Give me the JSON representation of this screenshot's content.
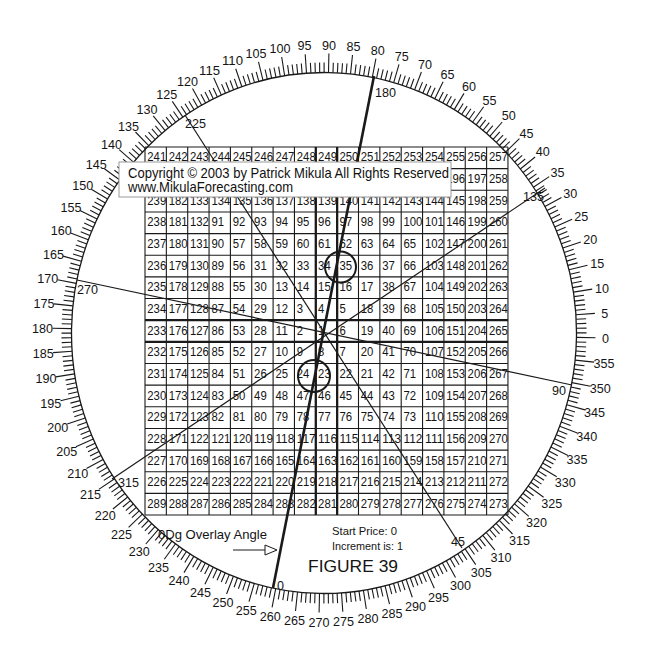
{
  "figure": {
    "caption": "FIGURE  39",
    "start_price": "Start Price: 0",
    "increment": "Increment is: 1",
    "overlay_angle_note": "0Dg Overlay Angle",
    "copyright_line1": "Copyright © 2003 by Patrick Mikula All Rights Reserved",
    "copyright_line2": "www.MikulaForecasting.com",
    "arrow_icon": "arrow-right-icon"
  },
  "degree_ring": {
    "tick_step_deg": 1,
    "label_step_deg": 5,
    "direction": "counterclockwise, 0 at right",
    "labels": [
      "0",
      "5",
      "10",
      "15",
      "20",
      "25",
      "30",
      "35",
      "40",
      "45",
      "50",
      "55",
      "60",
      "65",
      "70",
      "75",
      "80",
      "85",
      "90",
      "95",
      "100",
      "105",
      "110",
      "115",
      "120",
      "125",
      "130",
      "135",
      "140",
      "145",
      "150",
      "155",
      "160",
      "165",
      "170",
      "175",
      "180",
      "185",
      "190",
      "195",
      "200",
      "205",
      "210",
      "215",
      "220",
      "225",
      "230",
      "235",
      "240",
      "245",
      "250",
      "255",
      "260",
      "265",
      "270",
      "275",
      "280",
      "285",
      "290",
      "295",
      "300",
      "305",
      "310",
      "315",
      "320",
      "325",
      "330",
      "335",
      "340",
      "345",
      "350",
      "355"
    ]
  },
  "square_of_nine": {
    "start_price": 0,
    "increment": 1,
    "size": 17,
    "center_value": 1,
    "rows": [
      [
        241,
        242,
        243,
        244,
        245,
        246,
        247,
        248,
        249,
        250,
        251,
        252,
        253,
        254,
        255,
        256,
        257
      ],
      [
        240,
        183,
        184,
        185,
        186,
        187,
        188,
        189,
        190,
        191,
        192,
        193,
        194,
        195,
        196,
        197,
        258
      ],
      [
        239,
        182,
        133,
        134,
        135,
        136,
        137,
        138,
        139,
        140,
        141,
        142,
        143,
        144,
        145,
        198,
        259
      ],
      [
        238,
        181,
        132,
        91,
        92,
        93,
        94,
        95,
        96,
        97,
        98,
        99,
        100,
        101,
        146,
        199,
        260
      ],
      [
        237,
        180,
        131,
        90,
        57,
        58,
        59,
        60,
        61,
        62,
        63,
        64,
        65,
        102,
        147,
        200,
        261
      ],
      [
        236,
        179,
        130,
        89,
        56,
        31,
        32,
        33,
        34,
        35,
        36,
        37,
        66,
        103,
        148,
        201,
        262
      ],
      [
        235,
        178,
        129,
        88,
        55,
        30,
        13,
        14,
        15,
        16,
        17,
        38,
        67,
        104,
        149,
        202,
        263
      ],
      [
        234,
        177,
        128,
        87,
        54,
        29,
        12,
        3,
        4,
        5,
        18,
        39,
        68,
        105,
        150,
        203,
        264
      ],
      [
        233,
        176,
        127,
        86,
        53,
        28,
        11,
        2,
        1,
        6,
        19,
        40,
        69,
        106,
        151,
        204,
        265
      ],
      [
        232,
        175,
        126,
        85,
        52,
        27,
        10,
        9,
        8,
        7,
        20,
        41,
        70,
        107,
        152,
        205,
        266
      ],
      [
        231,
        174,
        125,
        84,
        51,
        26,
        25,
        24,
        23,
        22,
        21,
        42,
        71,
        108,
        153,
        206,
        267
      ],
      [
        230,
        173,
        124,
        83,
        50,
        49,
        48,
        47,
        46,
        45,
        44,
        43,
        72,
        109,
        154,
        207,
        268
      ],
      [
        229,
        172,
        123,
        82,
        81,
        80,
        79,
        78,
        77,
        76,
        75,
        74,
        73,
        110,
        155,
        208,
        269
      ],
      [
        228,
        171,
        122,
        121,
        120,
        119,
        118,
        117,
        116,
        115,
        114,
        113,
        112,
        111,
        156,
        209,
        270
      ],
      [
        227,
        170,
        169,
        168,
        167,
        166,
        165,
        164,
        163,
        162,
        161,
        160,
        159,
        158,
        157,
        210,
        271
      ],
      [
        226,
        225,
        224,
        223,
        222,
        221,
        220,
        219,
        218,
        217,
        216,
        215,
        214,
        213,
        212,
        211,
        272
      ],
      [
        289,
        288,
        287,
        286,
        285,
        284,
        283,
        282,
        281,
        280,
        279,
        278,
        277,
        276,
        275,
        274,
        273
      ]
    ]
  },
  "overlay": {
    "lines": [
      {
        "start_label": "180",
        "end_label": "0",
        "emphasis": "bold"
      },
      {
        "start_label": "225",
        "end_label": "45",
        "emphasis": "normal"
      },
      {
        "start_label": "270",
        "end_label": "90",
        "emphasis": "normal"
      },
      {
        "start_label": "135",
        "end_label": "315",
        "emphasis": "normal"
      }
    ]
  },
  "highlights": [
    {
      "value": "35",
      "row": 5,
      "col": 9
    },
    {
      "value": "23",
      "row": 10,
      "col": 8
    }
  ],
  "colors": {
    "ink": "#1a1a1a",
    "background": "#ffffff",
    "box_border": "#9a9a9a"
  }
}
